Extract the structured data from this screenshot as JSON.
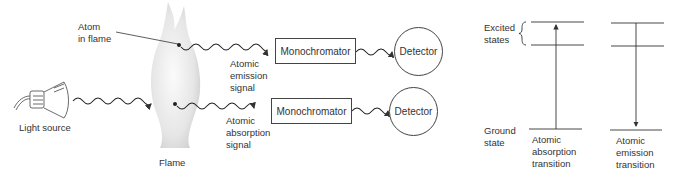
{
  "apparatus": {
    "light_source_label": "Light source",
    "flame_label": "Flame",
    "atom_label_line1": "Atom",
    "atom_label_line2": "in flame",
    "emission_path": {
      "signal_label_line1": "Atomic",
      "signal_label_line2": "emission",
      "signal_label_line3": "signal",
      "monochromator_label": "Monochromator",
      "detector_label": "Detector"
    },
    "absorption_path": {
      "signal_label_line1": "Atomic",
      "signal_label_line2": "absorption",
      "signal_label_line3": "signal",
      "monochromator_label": "Monochromator",
      "detector_label": "Detector"
    }
  },
  "energy_levels": {
    "excited_label_line1": "Excited",
    "excited_label_line2": "states",
    "ground_label_line1": "Ground",
    "ground_label_line2": "state",
    "absorption_transition": {
      "label_line1": "Atomic",
      "label_line2": "absorption",
      "label_line3": "transition",
      "direction": "up"
    },
    "emission_transition": {
      "label_line1": "Atomic",
      "label_line2": "emission",
      "label_line3": "transition",
      "direction": "down"
    }
  },
  "colors": {
    "line": "#333333",
    "flame_light": "#f4f4f4",
    "flame_shade": "#d6d6d6"
  }
}
